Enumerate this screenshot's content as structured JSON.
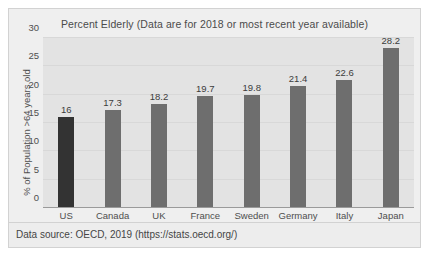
{
  "chart_data": {
    "type": "bar",
    "title": "Percent Elderly (Data are for 2018 or most recent year available)",
    "xlabel": "",
    "ylabel": "% of Population >64 years old",
    "categories": [
      "US",
      "Canada",
      "UK",
      "France",
      "Sweden",
      "Germany",
      "Italy",
      "Japan"
    ],
    "values": [
      16,
      17.3,
      18.2,
      19.7,
      19.8,
      21.4,
      22.6,
      28.2
    ],
    "value_labels": [
      "16",
      "17.3",
      "18.2",
      "19.7",
      "19.8",
      "21.4",
      "22.6",
      "28.2"
    ],
    "ylim": [
      0,
      30
    ],
    "yticks": [
      0,
      5,
      10,
      15,
      20,
      25,
      30
    ],
    "ytick_labels": [
      "0",
      "5",
      "10",
      "15",
      "20",
      "25",
      "30"
    ],
    "grid": true,
    "legend": false,
    "highlight_index": 0,
    "bar_color": "#6e6e6e",
    "highlight_color": "#333333",
    "plot_background": "#e3e3e3",
    "figure_background": "#efefef"
  },
  "source": {
    "text": "Data source: OECD, 2019 (https://stats.oecd.org/)"
  }
}
